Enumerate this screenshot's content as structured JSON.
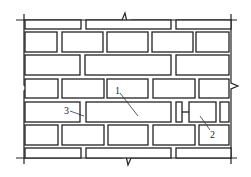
{
  "diagram": {
    "type": "brick-wall-elevation",
    "stroke_color": "#222222",
    "background": "#ffffff",
    "labels": [
      {
        "id": "1",
        "text": "1",
        "x": 115,
        "y": 94,
        "leader": [
          120,
          93,
          138,
          116
        ]
      },
      {
        "id": "2",
        "text": "2",
        "x": 210,
        "y": 138,
        "leader": [
          200,
          116,
          210,
          130
        ]
      },
      {
        "id": "3",
        "text": "3",
        "x": 64,
        "y": 114,
        "leader": [
          70,
          111,
          84,
          116
        ]
      }
    ],
    "rows": [
      {
        "y": 20,
        "h": 9,
        "bricks": [
          [
            25,
            81
          ],
          [
            86,
            171
          ],
          [
            176,
            231
          ]
        ]
      },
      {
        "y": 32,
        "h": 20,
        "bricks": [
          [
            25,
            57
          ],
          [
            62,
            103
          ],
          [
            107,
            148
          ],
          [
            152,
            193
          ],
          [
            196,
            229
          ]
        ]
      },
      {
        "y": 55,
        "h": 20,
        "bricks": [
          [
            25,
            80
          ],
          [
            85,
            171
          ],
          [
            176,
            229
          ]
        ]
      },
      {
        "y": 79,
        "h": 19,
        "bricks": [
          [
            25,
            58
          ],
          [
            62,
            104
          ],
          [
            107,
            148
          ],
          [
            153,
            195
          ],
          [
            199,
            229
          ]
        ]
      },
      {
        "y": 102,
        "h": 20,
        "bricks": [
          [
            25,
            80
          ],
          [
            86,
            171
          ],
          [
            176,
            182
          ],
          [
            189,
            216
          ],
          [
            220,
            229
          ]
        ]
      },
      {
        "y": 125,
        "h": 20,
        "bricks": [
          [
            25,
            58
          ],
          [
            62,
            104
          ],
          [
            108,
            148
          ],
          [
            153,
            195
          ],
          [
            199,
            229
          ]
        ]
      },
      {
        "y": 148,
        "h": 10,
        "bricks": [
          [
            25,
            81
          ],
          [
            86,
            171
          ],
          [
            176,
            231
          ]
        ]
      }
    ],
    "tie_connector": {
      "x1": 182,
      "x2": 189,
      "y": 112
    }
  }
}
